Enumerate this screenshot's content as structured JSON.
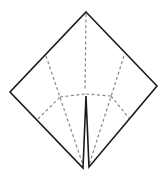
{
  "diagram": {
    "type": "origami-fold-diagram",
    "colors": {
      "background": "#ffffff",
      "outline": "#1a1a1a",
      "crease": "#888888"
    },
    "outline_points": "86,12 157,86 89,167 86,96 83,168 10,92",
    "creases": [
      {
        "name": "center-vertical-crease",
        "x1": 86,
        "y1": 14,
        "x2": 85,
        "y2": 90
      },
      {
        "name": "left-diagonal-crease",
        "x1": 46,
        "y1": 56,
        "x2": 83,
        "y2": 165
      },
      {
        "name": "right-diagonal-crease",
        "x1": 124,
        "y1": 56,
        "x2": 89,
        "y2": 165
      },
      {
        "name": "left-horizontal-crease",
        "x1": 60,
        "y1": 97,
        "x2": 85,
        "y2": 94
      },
      {
        "name": "right-horizontal-crease",
        "x1": 86,
        "y1": 94,
        "x2": 111,
        "y2": 96
      },
      {
        "name": "left-lower-crease",
        "x1": 38,
        "y1": 119,
        "x2": 60,
        "y2": 97
      },
      {
        "name": "right-lower-crease",
        "x1": 111,
        "y1": 96,
        "x2": 129,
        "y2": 118
      }
    ]
  }
}
